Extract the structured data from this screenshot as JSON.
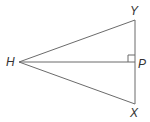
{
  "diagram": {
    "type": "geometry-triangle",
    "stroke_color": "#6b6b6b",
    "points": {
      "H": {
        "label": "H",
        "x": 19,
        "y": 62
      },
      "Y": {
        "label": "Y",
        "x": 135,
        "y": 20
      },
      "P": {
        "label": "P",
        "x": 135,
        "y": 62
      },
      "X": {
        "label": "X",
        "x": 135,
        "y": 104
      }
    },
    "segments": [
      "HY",
      "HX",
      "HP",
      "YX"
    ],
    "right_angle_at": "P"
  }
}
